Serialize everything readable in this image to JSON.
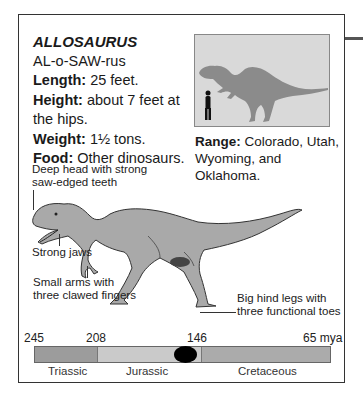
{
  "card": {
    "name": "ALLOSAURUS",
    "pronunciation": "AL-o-SAW-rus",
    "facts": [
      {
        "label": "Length:",
        "value": " 25 feet."
      },
      {
        "label": "Height:",
        "value": " about 7 feet at the hips."
      },
      {
        "label": "Weight:",
        "value": " 1½ tons."
      },
      {
        "label": "Food:",
        "value": " Other dinosaurs."
      }
    ],
    "range": {
      "label": "Range:",
      "value": " Colorado, Utah, Wyoming, and Oklahoma."
    }
  },
  "callouts": {
    "head": "Deep head with strong saw-edged teeth",
    "jaws": "Strong jaws",
    "arms": "Small arms with three clawed fingers",
    "legs": "Big hind legs with three functional toes"
  },
  "timeline": {
    "ticks": [
      {
        "label": "245",
        "x": 24
      },
      {
        "label": "208",
        "x": 86
      },
      {
        "label": "146",
        "x": 187
      },
      {
        "label": "65 mya",
        "x": 303
      }
    ],
    "eras": [
      {
        "name": "Triassic",
        "x": 48,
        "width": 62,
        "color": "#9c9c9c"
      },
      {
        "name": "Jurassic",
        "x": 126,
        "width": 103,
        "color": "#cacaca"
      },
      {
        "name": "Cretaceous",
        "x": 238,
        "width": 132,
        "color": "#ababab"
      }
    ],
    "marker_color": "#000000"
  },
  "colors": {
    "silhouette_bg": "#d9d9d9",
    "silhouette_dino": "#8b8b8b",
    "illustration_fill": "#a9a9a9"
  }
}
